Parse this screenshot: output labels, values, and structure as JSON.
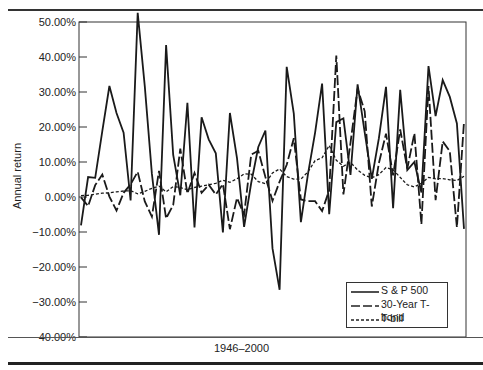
{
  "chart_data": {
    "type": "line",
    "title": "",
    "xlabel": "1946–2000",
    "ylabel": "Annual return",
    "ylim": [
      -40,
      50
    ],
    "yticks": [
      "50.00%",
      "40.00%",
      "30.00%",
      "20.00%",
      "10.00%",
      "0.00%",
      "−10.00%",
      "−20.00%",
      "−30.00%",
      "−40.00%"
    ],
    "grid": false,
    "legend_position": "lower right",
    "x": [
      1946,
      1947,
      1948,
      1949,
      1950,
      1951,
      1952,
      1953,
      1954,
      1955,
      1956,
      1957,
      1958,
      1959,
      1960,
      1961,
      1962,
      1963,
      1964,
      1965,
      1966,
      1967,
      1968,
      1969,
      1970,
      1971,
      1972,
      1973,
      1974,
      1975,
      1976,
      1977,
      1978,
      1979,
      1980,
      1981,
      1982,
      1983,
      1984,
      1985,
      1986,
      1987,
      1988,
      1989,
      1990,
      1991,
      1992,
      1993,
      1994,
      1995,
      1996,
      1997,
      1998,
      1999,
      2000
    ],
    "series": [
      {
        "name": "S & P 500",
        "style": "solid",
        "values": [
          -8.1,
          5.7,
          5.5,
          18.8,
          31.7,
          24.0,
          18.4,
          -1.0,
          52.6,
          31.6,
          6.6,
          -10.8,
          43.4,
          12.0,
          0.5,
          26.9,
          -8.7,
          22.8,
          16.5,
          12.5,
          -10.1,
          24.0,
          11.1,
          -8.5,
          4.0,
          14.3,
          19.0,
          -14.7,
          -26.5,
          37.2,
          23.8,
          -7.2,
          6.6,
          18.4,
          32.4,
          -4.9,
          21.4,
          22.5,
          6.3,
          32.2,
          18.5,
          5.2,
          16.8,
          31.5,
          -3.2,
          30.6,
          7.7,
          10.0,
          1.3,
          37.4,
          23.1,
          33.4,
          28.6,
          21.0,
          -9.1
        ]
      },
      {
        "name": "30-Year T-bond",
        "style": "dashed",
        "values": [
          -0.1,
          -2.6,
          3.4,
          6.4,
          0.1,
          -3.9,
          1.2,
          3.6,
          7.2,
          -1.3,
          -5.6,
          7.5,
          -6.1,
          -2.3,
          13.8,
          1.0,
          6.9,
          1.2,
          3.5,
          0.7,
          3.7,
          -9.2,
          -0.3,
          -5.1,
          12.1,
          13.2,
          5.7,
          -1.1,
          4.4,
          9.2,
          16.8,
          -0.7,
          -1.2,
          -1.2,
          -4.0,
          1.9,
          40.4,
          0.7,
          15.5,
          31.0,
          24.5,
          -2.7,
          9.7,
          18.1,
          6.2,
          19.3,
          8.1,
          18.2,
          -7.8,
          31.7,
          -0.9,
          15.9,
          13.1,
          -8.7,
          21.5
        ]
      },
      {
        "name": "T-bill",
        "style": "dotted",
        "values": [
          0.4,
          0.5,
          0.8,
          1.1,
          1.2,
          1.5,
          1.7,
          1.8,
          0.9,
          1.6,
          2.5,
          3.1,
          1.5,
          3.0,
          2.7,
          2.1,
          2.7,
          3.1,
          3.5,
          3.9,
          4.8,
          4.2,
          5.2,
          6.6,
          6.5,
          4.4,
          3.8,
          6.9,
          8.0,
          5.8,
          5.1,
          5.1,
          7.2,
          10.4,
          11.2,
          14.7,
          10.5,
          8.8,
          9.9,
          7.7,
          6.2,
          5.5,
          6.4,
          8.4,
          7.8,
          5.6,
          3.5,
          2.9,
          3.9,
          5.6,
          5.2,
          5.3,
          4.9,
          4.7,
          5.9
        ]
      }
    ]
  },
  "legend": {
    "items": [
      "S & P 500",
      "30-Year T-bond",
      "T-bill"
    ]
  },
  "axis": {
    "xlabel": "1946–2000",
    "ylabel": "Annual return"
  }
}
